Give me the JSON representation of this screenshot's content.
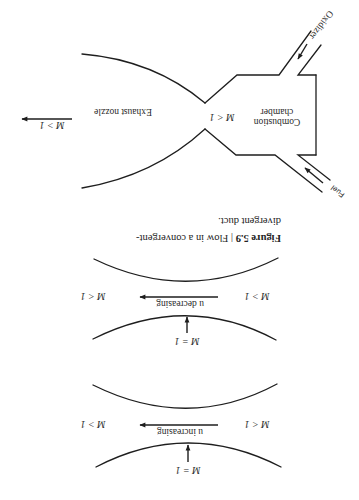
{
  "figure": {
    "orientation": "rotated 180 degrees",
    "caption": {
      "label": "Figure 5.9",
      "separator": " | ",
      "line1_text": "Flow in a convergent-",
      "line2_text": "divergent duct."
    },
    "rocket": {
      "chamber_label_line1": "Combustion",
      "chamber_label_line2": "chamber",
      "chamber_mach": "M < 1",
      "nozzle_label": "Exhaust nozzle",
      "exit_mach": "M > 1",
      "fuel_label": "Fuel",
      "oxidizer_label": "Oxidizer"
    },
    "duct_decreasing": {
      "inlet_mach": "M > 1",
      "outlet_mach": "M < 1",
      "flow_label": "u decreasing",
      "throat_mach": "M = 1"
    },
    "duct_increasing": {
      "inlet_mach": "M < 1",
      "outlet_mach": "M > 1",
      "flow_label": "u increasing",
      "throat_mach": "M = 1"
    }
  },
  "colors": {
    "line": "#1e1e1e",
    "background": "#ffffff"
  }
}
